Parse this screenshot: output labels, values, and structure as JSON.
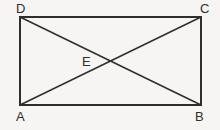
{
  "figure": {
    "type": "geometry-diagram",
    "shape": "rectangle-with-diagonals",
    "background_color": "#f6f5f3",
    "line_color": "#2e2e2e",
    "label_color": "#2e2e2e",
    "rectangle": {
      "left": 20,
      "top": 17,
      "right": 201,
      "bottom": 105,
      "width": 181,
      "height": 88,
      "stroke_width": 1.6
    },
    "diagonals": [
      {
        "name": "diagonal-AC",
        "from": "A",
        "to": "C",
        "x1": 20,
        "y1": 105,
        "x2": 201,
        "y2": 17
      },
      {
        "name": "diagonal-DB",
        "from": "D",
        "to": "B",
        "x1": 20,
        "y1": 17,
        "x2": 201,
        "y2": 105
      }
    ],
    "intersection": {
      "name": "E",
      "x": 110.5,
      "y": 61
    },
    "vertices": [
      {
        "id": "A",
        "label": "A",
        "x": 20,
        "y": 105,
        "position": "bottom-left"
      },
      {
        "id": "B",
        "label": "B",
        "x": 201,
        "y": 105,
        "position": "bottom-right"
      },
      {
        "id": "C",
        "label": "C",
        "x": 201,
        "y": 17,
        "position": "top-right"
      },
      {
        "id": "D",
        "label": "D",
        "x": 20,
        "y": 17,
        "position": "top-left"
      },
      {
        "id": "E",
        "label": "E",
        "x": 110.5,
        "y": 61,
        "position": "center"
      }
    ]
  }
}
